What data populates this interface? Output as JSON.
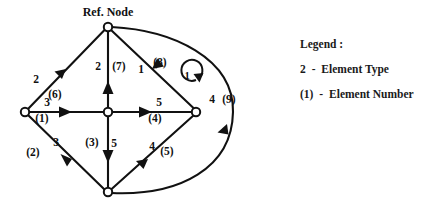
{
  "diagram": {
    "ref_node_caption": "Ref. Node",
    "nodes": [
      {
        "id": "top",
        "x": 108,
        "y": 27,
        "r": 4.2
      },
      {
        "id": "left",
        "x": 25,
        "y": 112,
        "r": 4.2
      },
      {
        "id": "center",
        "x": 108,
        "y": 112,
        "r": 4.2
      },
      {
        "id": "right",
        "x": 196,
        "y": 112,
        "r": 4.2
      },
      {
        "id": "bottom",
        "x": 108,
        "y": 192,
        "r": 4.2
      }
    ],
    "edges": [
      {
        "number": "(1)",
        "type": "3",
        "from": "left",
        "to": "center",
        "type_label_x": 47,
        "type_label_y": 106,
        "num_label_x": 42,
        "num_label_y": 122
      },
      {
        "number": "(2)",
        "type": "3",
        "from": "left",
        "to": "bottom",
        "type_label_x": 56,
        "type_label_y": 146,
        "num_label_x": 33,
        "num_label_y": 156
      },
      {
        "number": "(3)",
        "type": "5",
        "from": "center",
        "to": "bottom",
        "type_label_x": 114,
        "type_label_y": 147,
        "num_label_x": 92,
        "num_label_y": 146
      },
      {
        "number": "(4)",
        "type": "5",
        "from": "center",
        "to": "right",
        "type_label_x": 159,
        "type_label_y": 106,
        "num_label_x": 155,
        "num_label_y": 122
      },
      {
        "number": "(5)",
        "type": "4",
        "from": "bottom",
        "to": "right",
        "type_label_x": 152,
        "type_label_y": 150,
        "num_label_x": 167,
        "num_label_y": 155
      },
      {
        "number": "(6)",
        "type": "2",
        "from": "left",
        "to": "top",
        "type_label_x": 36,
        "type_label_y": 83,
        "num_label_x": 55,
        "num_label_y": 98
      },
      {
        "number": "(7)",
        "type": "2",
        "from": "center",
        "to": "top",
        "type_label_x": 98,
        "type_label_y": 70,
        "num_label_x": 114,
        "num_label_y": 70
      },
      {
        "number": "(8)",
        "type": "1",
        "from": "right",
        "to": "top",
        "type_label_x": 141,
        "type_label_y": 73,
        "num_label_x": 155,
        "num_label_y": 66
      },
      {
        "number": "(9)",
        "type": "4",
        "from": "bottom",
        "to": "top",
        "type_label_x": 212,
        "type_label_y": 103,
        "num_label_x": 227,
        "num_label_y": 103
      }
    ],
    "loop": {
      "label": "1",
      "label_x": 187,
      "label_y": 79,
      "cx": 189,
      "cy": 74,
      "r": 10.5
    }
  },
  "legend": {
    "title": "Legend :",
    "rows": [
      {
        "key": "2",
        "dash": "-",
        "desc": "Element Type"
      },
      {
        "key": "(1)",
        "dash": "-",
        "desc": "Element Number"
      }
    ]
  }
}
